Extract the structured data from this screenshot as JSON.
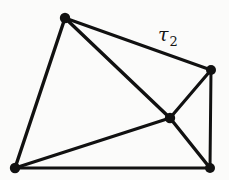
{
  "figure": {
    "width": 229,
    "height": 180,
    "background_color": "#fbfbfa",
    "ink_color": "#111111"
  },
  "diagram_data": {
    "type": "graph",
    "vertex_shape": "filled-circle",
    "vertex_radius": 5,
    "vertices": [
      {
        "id": "v-top-left",
        "name": "top-left-vertex",
        "x": 65,
        "y": 18,
        "r": 5.2
      },
      {
        "id": "v-right",
        "name": "right-vertex",
        "x": 211,
        "y": 70,
        "r": 5.0
      },
      {
        "id": "v-center",
        "name": "center-vertex",
        "x": 170,
        "y": 118,
        "r": 5.2
      },
      {
        "id": "v-bottom-left",
        "name": "bottom-left-vertex",
        "x": 15,
        "y": 168,
        "r": 5.2
      },
      {
        "id": "v-bottom-right",
        "name": "bottom-right-vertex",
        "x": 210,
        "y": 168,
        "r": 5.0
      }
    ],
    "edges": [
      {
        "id": "e-tl-r",
        "name": "edge-top-left-to-right",
        "from": "v-top-left",
        "to": "v-right",
        "x1": 65,
        "y1": 18,
        "x2": 211,
        "y2": 70,
        "width": 3.0,
        "label": "tau_2"
      },
      {
        "id": "e-tl-c",
        "name": "edge-top-left-to-center",
        "from": "v-top-left",
        "to": "v-center",
        "x1": 65,
        "y1": 18,
        "x2": 170,
        "y2": 118,
        "width": 3.4,
        "label": ""
      },
      {
        "id": "e-tl-bl",
        "name": "edge-top-left-to-bottom-left",
        "from": "v-top-left",
        "to": "v-bottom-left",
        "x1": 65,
        "y1": 18,
        "x2": 15,
        "y2": 168,
        "width": 3.4,
        "label": ""
      },
      {
        "id": "e-r-c",
        "name": "edge-right-to-center",
        "from": "v-right",
        "to": "v-center",
        "x1": 211,
        "y1": 70,
        "x2": 170,
        "y2": 118,
        "width": 3.2,
        "label": ""
      },
      {
        "id": "e-r-br",
        "name": "edge-right-to-bottom-right",
        "from": "v-right",
        "to": "v-bottom-right",
        "x1": 211,
        "y1": 70,
        "x2": 210,
        "y2": 168,
        "width": 3.0,
        "label": ""
      },
      {
        "id": "e-c-bl",
        "name": "edge-center-to-bottom-left",
        "from": "v-center",
        "to": "v-bottom-left",
        "x1": 170,
        "y1": 118,
        "x2": 15,
        "y2": 168,
        "width": 3.2,
        "label": ""
      },
      {
        "id": "e-c-br",
        "name": "edge-center-to-bottom-right",
        "from": "v-center",
        "to": "v-bottom-right",
        "x1": 170,
        "y1": 118,
        "x2": 210,
        "y2": 168,
        "width": 3.4,
        "label": ""
      },
      {
        "id": "e-bl-br",
        "name": "edge-bottom-left-to-bottom-right",
        "from": "v-bottom-left",
        "to": "v-bottom-right",
        "x1": 15,
        "y1": 168,
        "x2": 210,
        "y2": 168,
        "width": 3.2,
        "label": ""
      }
    ],
    "labels": [
      {
        "id": "lbl-tau-2",
        "name": "tau-2-label",
        "symbol": "τ",
        "subscript": "2",
        "full_text": "τ₂",
        "x": 158,
        "y": 25,
        "attached_edge": "e-tl-r"
      }
    ],
    "counts": {
      "vertices": 5,
      "edges": 8,
      "labels": 1
    }
  }
}
